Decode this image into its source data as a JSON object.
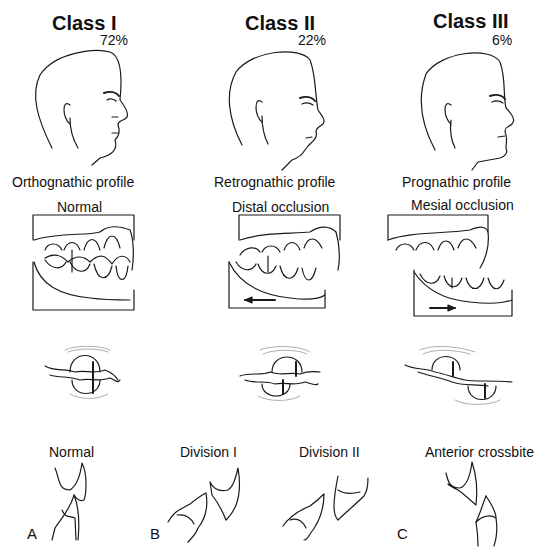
{
  "figure": {
    "columns": [
      {
        "class_title": "Class I",
        "percentage": "72%",
        "profile_label": "Orthognathic profile",
        "occlusion_label": "Normal",
        "occlusion_arrow": "none"
      },
      {
        "class_title": "Class II",
        "percentage": "22%",
        "profile_label": "Retrognathic profile",
        "occlusion_label": "Distal occlusion",
        "occlusion_arrow": "left"
      },
      {
        "class_title": "Class III",
        "percentage": "6%",
        "profile_label": "Prognathic profile",
        "occlusion_label": "Mesial occlusion",
        "occlusion_arrow": "right"
      }
    ],
    "incisor_panels": [
      {
        "letter": "A",
        "labels": [
          "Normal"
        ]
      },
      {
        "letter": "B",
        "labels": [
          "Division I",
          "Division II"
        ]
      },
      {
        "letter": "C",
        "labels": [
          "Anterior crossbite"
        ]
      }
    ]
  }
}
